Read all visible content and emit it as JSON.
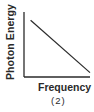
{
  "chart_data": {
    "type": "line",
    "title": "",
    "xlabel": "Frequency",
    "ylabel": "Photon Energy",
    "caption": "(2)",
    "grid": false,
    "legend": null,
    "ticks": {
      "x": [],
      "y": []
    },
    "series": [
      {
        "name": "Photon Energy vs Frequency",
        "x": [
          0.1,
          1.0
        ],
        "y": [
          0.9,
          0.07
        ],
        "trend": "decreasing linear"
      }
    ],
    "xlim": [
      0,
      1
    ],
    "ylim": [
      0,
      1
    ],
    "colors": {
      "line": "#2a2a2a",
      "axes": "#2a2a2a",
      "text": "#2a2a2a"
    }
  },
  "figure": {
    "top_cut_text": "",
    "xlabel": "Frequency",
    "ylabel": "Photon Energy",
    "caption": "(2)"
  }
}
